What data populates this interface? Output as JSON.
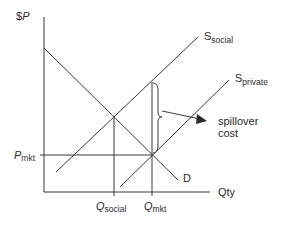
{
  "diagram": {
    "type": "economics-externality-supply-demand",
    "axes": {
      "y_label_prefix": "$",
      "y_label_var": "P",
      "x_label": "Qty"
    },
    "curves": {
      "s_social": {
        "base": "S",
        "sub": "social"
      },
      "s_private": {
        "base": "S",
        "sub": "private"
      },
      "demand": {
        "label": "D"
      }
    },
    "markers": {
      "p_mkt": {
        "base": "P",
        "sub": "mkt"
      },
      "q_social": {
        "base": "Q",
        "sub": "social"
      },
      "q_mkt": {
        "base": "Q",
        "sub": "mkt"
      }
    },
    "annotation": {
      "line1": "spillover",
      "line2": "cost"
    },
    "colors": {
      "line": "#3a3a3a",
      "text": "#2a2a2a",
      "background": "#ffffff"
    }
  }
}
